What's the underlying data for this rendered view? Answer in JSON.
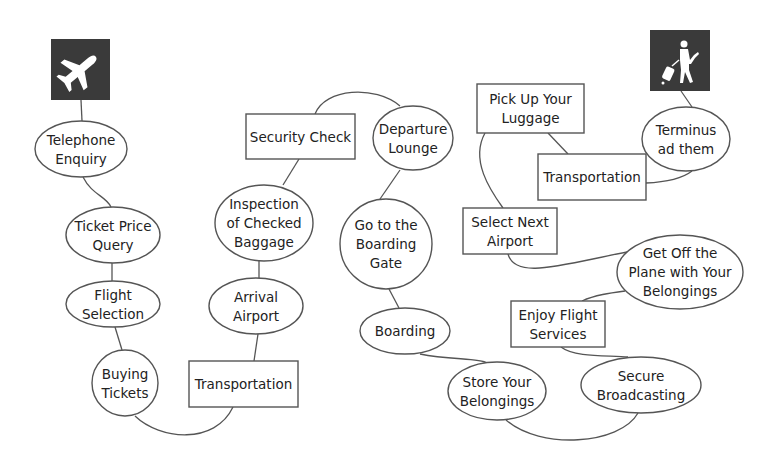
{
  "diagram": {
    "title": "",
    "colors": {
      "line": "#555555",
      "icon_bg": "#3a3a3a",
      "node_fill": "#ffffff",
      "text": "#222222"
    },
    "icons": [
      {
        "name": "airplane-icon",
        "x": 51,
        "y": 39,
        "w": 59,
        "h": 61
      },
      {
        "name": "traveler-with-luggage-icon",
        "x": 650,
        "y": 30,
        "w": 60,
        "h": 61
      }
    ],
    "nodes": [
      {
        "id": "n1",
        "shape": "ellipse",
        "cx": 81,
        "cy": 149,
        "rx": 46,
        "ry": 28,
        "lines": [
          "Telephone",
          "Enquiry"
        ]
      },
      {
        "id": "n2",
        "shape": "ellipse",
        "cx": 113,
        "cy": 235,
        "rx": 47,
        "ry": 28,
        "lines": [
          "Ticket Price",
          "Query"
        ]
      },
      {
        "id": "n3",
        "shape": "ellipse",
        "cx": 113,
        "cy": 304,
        "rx": 47,
        "ry": 23,
        "lines": [
          "Flight",
          "Selection"
        ]
      },
      {
        "id": "n4",
        "shape": "ellipse",
        "cx": 125,
        "cy": 383,
        "rx": 33,
        "ry": 33,
        "lines": [
          "Buying",
          "Tickets"
        ]
      },
      {
        "id": "n5",
        "shape": "rect",
        "x": 189,
        "y": 361,
        "w": 109,
        "h": 46,
        "lines": [
          "Transportation"
        ]
      },
      {
        "id": "n6",
        "shape": "ellipse",
        "cx": 256,
        "cy": 306,
        "rx": 47,
        "ry": 28,
        "lines": [
          "Arrival",
          "Airport"
        ]
      },
      {
        "id": "n7",
        "shape": "ellipse",
        "cx": 264,
        "cy": 223,
        "rx": 49,
        "ry": 38,
        "lines": [
          "Inspection",
          "of Checked",
          "Baggage"
        ]
      },
      {
        "id": "n8",
        "shape": "rect",
        "x": 246,
        "y": 114,
        "w": 109,
        "h": 45,
        "lines": [
          "Security Check"
        ]
      },
      {
        "id": "n9",
        "shape": "ellipse",
        "cx": 413,
        "cy": 138,
        "rx": 40,
        "ry": 32,
        "lines": [
          "Departure",
          "Lounge"
        ]
      },
      {
        "id": "n10",
        "shape": "ellipse",
        "cx": 386,
        "cy": 244,
        "rx": 46,
        "ry": 45,
        "lines": [
          "Go to the",
          "Boarding",
          "Gate"
        ]
      },
      {
        "id": "n11",
        "shape": "ellipse",
        "cx": 405,
        "cy": 331,
        "rx": 45,
        "ry": 23,
        "lines": [
          "Boarding"
        ]
      },
      {
        "id": "n12",
        "shape": "ellipse",
        "cx": 497,
        "cy": 391,
        "rx": 49,
        "ry": 29,
        "lines": [
          "Store Your",
          "Belongings"
        ]
      },
      {
        "id": "n13",
        "shape": "ellipse",
        "cx": 641,
        "cy": 385,
        "rx": 60,
        "ry": 28,
        "lines": [
          "Secure",
          "Broadcasting"
        ]
      },
      {
        "id": "n14",
        "shape": "rect",
        "x": 511,
        "y": 301,
        "w": 94,
        "h": 46,
        "lines": [
          "Enjoy Flight",
          "Services"
        ]
      },
      {
        "id": "n15",
        "shape": "ellipse",
        "cx": 680,
        "cy": 272,
        "rx": 63,
        "ry": 37,
        "lines": [
          "Get Off the",
          "Plane with Your",
          "Belongings"
        ]
      },
      {
        "id": "n16",
        "shape": "rect",
        "x": 463,
        "y": 208,
        "w": 94,
        "h": 46,
        "lines": [
          "Select Next",
          "Airport"
        ]
      },
      {
        "id": "n17",
        "shape": "rect",
        "x": 477,
        "y": 84,
        "w": 107,
        "h": 49,
        "lines": [
          "Pick Up Your",
          "Luggage"
        ]
      },
      {
        "id": "n18",
        "shape": "rect",
        "x": 538,
        "y": 154,
        "w": 108,
        "h": 46,
        "lines": [
          "Transportation"
        ]
      },
      {
        "id": "n19",
        "shape": "ellipse",
        "cx": 686,
        "cy": 139,
        "rx": 44,
        "ry": 32,
        "lines": [
          "Terminus",
          "ad them"
        ]
      }
    ],
    "edges": [
      {
        "d": "M81,100 L82,121"
      },
      {
        "d": "M83,177 C92,195 106,196 111,207"
      },
      {
        "d": "M112,263 L112,281"
      },
      {
        "d": "M115,327 L122,350"
      },
      {
        "d": "M135,416 C160,440 215,445 233,407"
      },
      {
        "d": "M254,361 L258,334"
      },
      {
        "d": "M259,278 L259,261"
      },
      {
        "d": "M283,185 L299,159"
      },
      {
        "d": "M315,114 C325,88 375,85 400,106"
      },
      {
        "d": "M400,170 L380,199"
      },
      {
        "d": "M389,289 L399,308"
      },
      {
        "d": "M420,354 C450,360 480,358 487,363"
      },
      {
        "d": "M506,420 C540,450 620,445 638,413"
      },
      {
        "d": "M561,347 C575,358 610,355 628,357"
      },
      {
        "d": "M582,301 C595,295 610,293 625,291"
      },
      {
        "d": "M508,254 C515,280 560,265 627,252"
      },
      {
        "d": "M485,133 C470,160 490,190 503,208"
      },
      {
        "d": "M548,133 L568,154"
      },
      {
        "d": "M646,183 C670,182 683,178 692,171"
      },
      {
        "d": "M681,91 L692,107"
      }
    ]
  }
}
